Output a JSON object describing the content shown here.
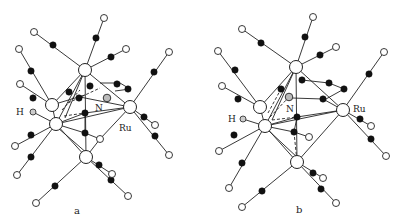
{
  "figure": {
    "panels": [
      {
        "id": "a",
        "caption": "a",
        "labels": {
          "hydride": "H",
          "nitrogen": "N",
          "metal": "Ru"
        }
      },
      {
        "id": "b",
        "caption": "b",
        "labels": {
          "hydride": "H",
          "nitrogen": "N",
          "metal": "Ru"
        }
      }
    ],
    "legend": {
      "metal_atom": "large open circle (Ru)",
      "carbon_atom": "filled black circle (C)",
      "oxygen_atom": "small open circle (O)",
      "nitrogen_atom": "hatched circle (N)",
      "hydrogen_atom": "small grey circle (H)"
    },
    "colors": {
      "background": "#ffffff",
      "line": "#222222",
      "carbon": "#111111",
      "nitrogen_fill": "#bbbbbb"
    }
  }
}
